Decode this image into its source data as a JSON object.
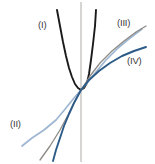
{
  "figure": {
    "name": "four-curves-comparison-figure",
    "background_color": "#ffffff",
    "width": 155,
    "height": 164
  },
  "axis": {
    "vertical_axis_label": "y-axis",
    "color": "#b5b2ae",
    "x_position": 81
  },
  "labels": {
    "curve_1": "(I)",
    "curve_2": "(II)",
    "curve_3": "(III)",
    "curve_4": "(IV)"
  },
  "colors": {
    "curve_1": "#1a1a1a",
    "curve_2": "#9db6d2",
    "curve_3": "#8e8a86",
    "curve_4": "#2d5b87",
    "axis": "#b5b2ae",
    "label_text": "#3a3a3a"
  },
  "chart_data": {
    "type": "line",
    "title": "",
    "xlabel": "",
    "ylabel": "",
    "grid": false,
    "legend": "inline-annotations",
    "axis_origin_px": [
      81,
      90
    ],
    "series": [
      {
        "name": "(I)",
        "label": "(I)",
        "color": "#1a1a1a",
        "description": "steep even-power curve, U-shaped with vertex at origin, both branches rise sharply",
        "points_px": [
          [
            57,
            10
          ],
          [
            60,
            26
          ],
          [
            63,
            42
          ],
          [
            66,
            56
          ],
          [
            69,
            68
          ],
          [
            72,
            77
          ],
          [
            75,
            84
          ],
          [
            78,
            88
          ],
          [
            81,
            90
          ],
          [
            84,
            88
          ],
          [
            87,
            83
          ],
          [
            89,
            74
          ],
          [
            91,
            60
          ],
          [
            93,
            44
          ],
          [
            95,
            26
          ],
          [
            96,
            10
          ]
        ]
      },
      {
        "name": "(II)",
        "label": "(II)",
        "color": "#9db6d2",
        "description": "odd-root style curve, flattens strongly to the lower left, steep through origin, rises to upper right",
        "points_px": [
          [
            22,
            146
          ],
          [
            32,
            138
          ],
          [
            44,
            130
          ],
          [
            56,
            120
          ],
          [
            66,
            108
          ],
          [
            74,
            98
          ],
          [
            81,
            90
          ],
          [
            88,
            82
          ],
          [
            96,
            72
          ],
          [
            106,
            60
          ],
          [
            118,
            48
          ],
          [
            130,
            38
          ],
          [
            142,
            29
          ]
        ]
      },
      {
        "name": "(III)",
        "label": "(III)",
        "color": "#8e8a86",
        "description": "near-linear curve through origin with moderate positive slope, slight concavity",
        "points_px": [
          [
            40,
            160
          ],
          [
            50,
            146
          ],
          [
            60,
            130
          ],
          [
            68,
            115
          ],
          [
            75,
            101
          ],
          [
            81,
            90
          ],
          [
            90,
            76
          ],
          [
            100,
            63
          ],
          [
            112,
            51
          ],
          [
            124,
            41
          ],
          [
            136,
            32
          ],
          [
            146,
            26
          ]
        ]
      },
      {
        "name": "(IV)",
        "label": "(IV)",
        "color": "#2d5b87",
        "description": "S-shaped cubic-root like curve, steep descent at lower left, shallow flattening toward upper right",
        "points_px": [
          [
            53,
            161
          ],
          [
            56,
            150
          ],
          [
            60,
            138
          ],
          [
            64,
            126
          ],
          [
            69,
            114
          ],
          [
            74,
            103
          ],
          [
            81,
            90
          ],
          [
            89,
            80
          ],
          [
            99,
            71
          ],
          [
            110,
            63
          ],
          [
            122,
            56
          ],
          [
            134,
            51
          ],
          [
            146,
            47
          ]
        ]
      }
    ]
  }
}
